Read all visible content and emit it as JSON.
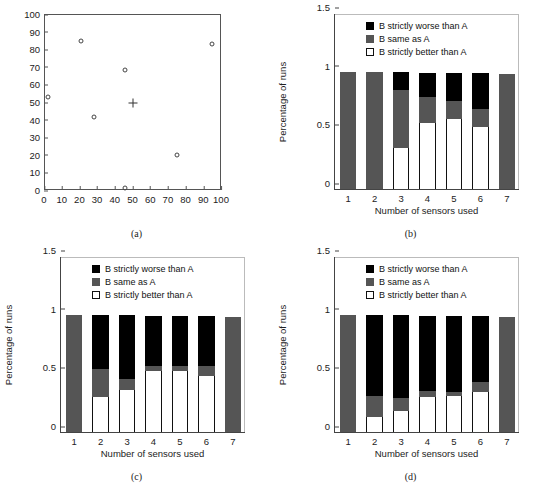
{
  "figure": {
    "panels": [
      {
        "id": "a",
        "caption": "(a)"
      },
      {
        "id": "b",
        "caption": "(b)"
      },
      {
        "id": "c",
        "caption": "(c)"
      },
      {
        "id": "d",
        "caption": "(d)"
      }
    ]
  },
  "legend": {
    "entries": [
      {
        "key": "worse",
        "label": "B strictly worse than A",
        "color": "#000000"
      },
      {
        "key": "same",
        "label": "B same as A",
        "color": "#555555"
      },
      {
        "key": "better",
        "label": "B strictly better than A",
        "color": "#ffffff"
      }
    ]
  },
  "chart_data": [
    {
      "panel": "a",
      "type": "scatter",
      "title": "",
      "xlabel": "",
      "ylabel": "",
      "xlim": [
        0,
        100
      ],
      "ylim": [
        0,
        100
      ],
      "xticks": [
        0,
        10,
        20,
        30,
        40,
        50,
        60,
        70,
        80,
        90,
        100
      ],
      "yticks": [
        0,
        10,
        20,
        30,
        40,
        50,
        60,
        70,
        80,
        90,
        100
      ],
      "grid": false,
      "series": [
        {
          "name": "circle-markers",
          "marker": "o",
          "points": [
            {
              "x": 2,
              "y": 53
            },
            {
              "x": 21,
              "y": 84.5
            },
            {
              "x": 28,
              "y": 41.5
            },
            {
              "x": 46,
              "y": 68
            },
            {
              "x": 46,
              "y": 1
            },
            {
              "x": 75,
              "y": 20
            },
            {
              "x": 95,
              "y": 83
            }
          ]
        },
        {
          "name": "plus-marker",
          "marker": "+",
          "points": [
            {
              "x": 50,
              "y": 49.5
            }
          ]
        }
      ]
    },
    {
      "panel": "b",
      "type": "bar",
      "stacked": true,
      "title": "",
      "xlabel": "Number of sensors used",
      "ylabel": "Percentage of runs",
      "categories": [
        "1",
        "2",
        "3",
        "4",
        "5",
        "6",
        "7"
      ],
      "ylim": [
        0,
        1.5
      ],
      "yticks": [
        0,
        0.5,
        1,
        1.5
      ],
      "ytick_labels": [
        "0",
        "0.5",
        "1",
        "1.5"
      ],
      "grid": false,
      "legend_position": "top-center",
      "series": [
        {
          "name": "B strictly better than A",
          "key": "better",
          "values": [
            0.0,
            0.0,
            0.35,
            0.56,
            0.6,
            0.53,
            0.0
          ]
        },
        {
          "name": "B same as A",
          "key": "same",
          "values": [
            1.0,
            1.0,
            0.49,
            0.22,
            0.15,
            0.15,
            0.98
          ]
        },
        {
          "name": "B strictly worse than A",
          "key": "worse",
          "values": [
            0.0,
            0.0,
            0.16,
            0.21,
            0.24,
            0.31,
            0.0
          ]
        }
      ]
    },
    {
      "panel": "c",
      "type": "bar",
      "stacked": true,
      "title": "",
      "xlabel": "Number of sensors used",
      "ylabel": "Percentage of runs",
      "categories": [
        "1",
        "2",
        "3",
        "4",
        "5",
        "6",
        "7"
      ],
      "ylim": [
        0,
        1.5
      ],
      "yticks": [
        0,
        0.5,
        1,
        1.5
      ],
      "ytick_labels": [
        "0",
        "0.5",
        "1",
        "1.5"
      ],
      "grid": false,
      "legend_position": "top-center",
      "series": [
        {
          "name": "B strictly better than A",
          "key": "better",
          "values": [
            0.0,
            0.3,
            0.36,
            0.52,
            0.52,
            0.48,
            0.0
          ]
        },
        {
          "name": "B same as A",
          "key": "same",
          "values": [
            1.0,
            0.24,
            0.09,
            0.04,
            0.04,
            0.08,
            0.98
          ]
        },
        {
          "name": "B strictly worse than A",
          "key": "worse",
          "values": [
            0.0,
            0.46,
            0.55,
            0.43,
            0.43,
            0.43,
            0.0
          ]
        }
      ]
    },
    {
      "panel": "d",
      "type": "bar",
      "stacked": true,
      "title": "",
      "xlabel": "Number of sensors used",
      "ylabel": "Percentage of runs",
      "categories": [
        "1",
        "2",
        "3",
        "4",
        "5",
        "6",
        "7"
      ],
      "ylim": [
        0,
        1.5
      ],
      "yticks": [
        0,
        0.5,
        1,
        1.5
      ],
      "ytick_labels": [
        "0",
        "0.5",
        "1",
        "1.5"
      ],
      "grid": false,
      "legend_position": "top-center",
      "series": [
        {
          "name": "B strictly better than A",
          "key": "better",
          "values": [
            0.0,
            0.13,
            0.18,
            0.3,
            0.31,
            0.34,
            0.0
          ]
        },
        {
          "name": "B same as A",
          "key": "same",
          "values": [
            1.0,
            0.18,
            0.11,
            0.05,
            0.03,
            0.09,
            0.98
          ]
        },
        {
          "name": "B strictly worse than A",
          "key": "worse",
          "values": [
            0.0,
            0.69,
            0.71,
            0.64,
            0.65,
            0.56,
            0.0
          ]
        }
      ]
    }
  ]
}
